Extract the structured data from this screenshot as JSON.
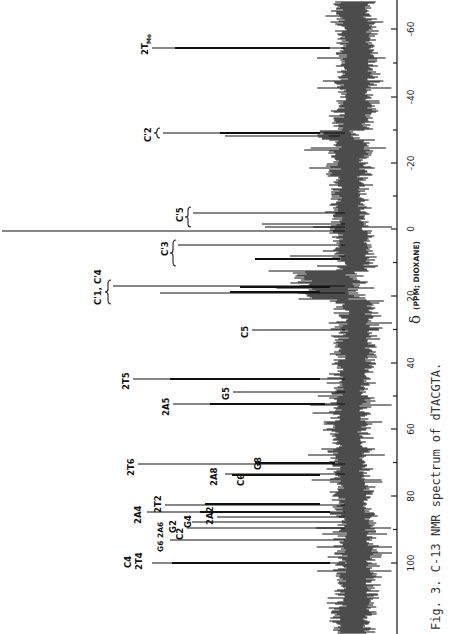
{
  "figure": {
    "caption": "Fig. 3.  C-13 NMR spectrum of dTACGTA.",
    "xaxis_symbol": "δ",
    "xaxis_label": "(PPM; DIOXANE)",
    "orientation": "rotated 90° (ppm axis vertical on right, peaks extend leftward)"
  },
  "chart_data": {
    "type": "line",
    "title": "C-13 NMR spectrum of dTACGTA",
    "caption": "Fig. 3.  C-13 NMR spectrum of dTACGTA.",
    "xlabel": "δ (PPM; DIOXANE)",
    "ylabel": "",
    "xlim": [
      115,
      -68
    ],
    "ticks": [
      100,
      80,
      60,
      40,
      20,
      0,
      -20,
      -40,
      -60
    ],
    "tick_labels": [
      "100",
      "80",
      "60",
      "40",
      "20",
      "0",
      "-20",
      "-40",
      "-60"
    ],
    "grid": false,
    "peaks": [
      {
        "label": "2T_Me",
        "ppm": -54.5,
        "rel_intensity": 0.56
      },
      {
        "label": "C2'",
        "ppm": -29,
        "rel_intensity": 0.53
      },
      {
        "label": "C5'",
        "ppm": -5,
        "rel_intensity": 0.44
      },
      {
        "label": "C5' (2)",
        "ppm": -1,
        "rel_intensity": 0.29
      },
      {
        "label": "reference (dioxane)",
        "ppm": 0,
        "rel_intensity": 1.0
      },
      {
        "label": "C3'",
        "ppm": 4.5,
        "rel_intensity": 0.49
      },
      {
        "label": "C3' (2)",
        "ppm": 9,
        "rel_intensity": 0.28
      },
      {
        "label": "C1', C4'",
        "ppm": 17,
        "rel_intensity": 0.67
      },
      {
        "label": "C1', C4' (2)",
        "ppm": 19,
        "rel_intensity": 0.52
      },
      {
        "label": "C5",
        "ppm": 30,
        "rel_intensity": 0.27
      },
      {
        "label": "2T5",
        "ppm": 45,
        "rel_intensity": 0.62
      },
      {
        "label": "G5",
        "ppm": 49,
        "rel_intensity": 0.31
      },
      {
        "label": "2A5",
        "ppm": 52,
        "rel_intensity": 0.5
      },
      {
        "label": "2T6",
        "ppm": 70,
        "rel_intensity": 0.6
      },
      {
        "label": "G8",
        "ppm": 70.5,
        "rel_intensity": 0.25
      },
      {
        "label": "2A8",
        "ppm": 73,
        "rel_intensity": 0.34
      },
      {
        "label": "C6",
        "ppm": 73.5,
        "rel_intensity": 0.34
      },
      {
        "label": "2T2",
        "ppm": 82.5,
        "rel_intensity": 0.53
      },
      {
        "label": "2A4",
        "ppm": 84.5,
        "rel_intensity": 0.58
      },
      {
        "label": "2A2",
        "ppm": 86,
        "rel_intensity": 0.37
      },
      {
        "label": "G4",
        "ppm": 87.5,
        "rel_intensity": 0.44
      },
      {
        "label": "G2",
        "ppm": 89,
        "rel_intensity": 0.46
      },
      {
        "label": "C2",
        "ppm": 89.5,
        "rel_intensity": 0.45
      },
      {
        "label": "G6, 2A6",
        "ppm": 93,
        "rel_intensity": 0.51
      },
      {
        "label": "C4, 2T4",
        "ppm": 100,
        "rel_intensity": 0.56
      }
    ]
  },
  "axis": {
    "ticks": [
      {
        "label": "100",
        "y": 563
      },
      {
        "label": "80",
        "y": 496
      },
      {
        "label": "60",
        "y": 429
      },
      {
        "label": "40",
        "y": 363
      },
      {
        "label": "20",
        "y": 296
      },
      {
        "label": "0",
        "y": 229
      },
      {
        "label": "-20",
        "y": 163
      },
      {
        "label": "-40",
        "y": 97
      },
      {
        "label": "-60",
        "y": 29
      }
    ]
  },
  "labels": {
    "tme": "2T",
    "tme_sub": "Me",
    "c2p": "C'2",
    "c5p": "C'5",
    "c3p": "C'3",
    "c1c4": "C'1, C'4",
    "c5": "C5",
    "t5": "2T5",
    "g5": "G5",
    "a5": "2A5",
    "t6": "2T6",
    "g8": "G8",
    "a8": "2A8",
    "c6": "C6",
    "t2": "2T2",
    "a4": "2A4",
    "a2": "2A2",
    "g4": "G4",
    "g2": "G2",
    "c2": "C2",
    "g6a6": "G6 2A6",
    "c4": "C4",
    "t4": "2T4"
  }
}
